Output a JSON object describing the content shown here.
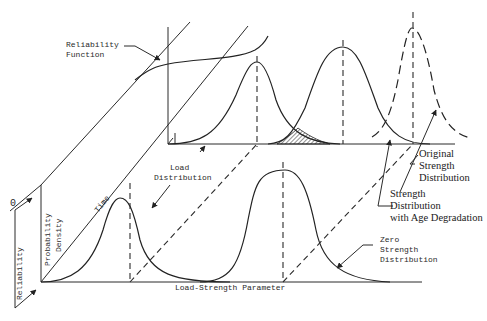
{
  "diagram": {
    "title": "",
    "labels": {
      "reliability_function": [
        "Reliability",
        "Function"
      ],
      "load_distribution": [
        "Load",
        "Distribution"
      ],
      "original_strength": [
        "Original",
        "Strength",
        "Distribution"
      ],
      "strength_age": [
        "Strength",
        "Distribution",
        "with Age Degradation"
      ],
      "zero_strength": [
        "Zero",
        "Strength",
        "Distribution"
      ],
      "time_axis": "Time",
      "probability_density_axis": [
        "Probability",
        "Density"
      ],
      "reliability_axis": "Reliability",
      "reliability_zero": "0",
      "load_strength_axis": "Load-Strength Parameter"
    },
    "colors": {
      "ink": "#222222",
      "background": "#ffffff"
    }
  }
}
